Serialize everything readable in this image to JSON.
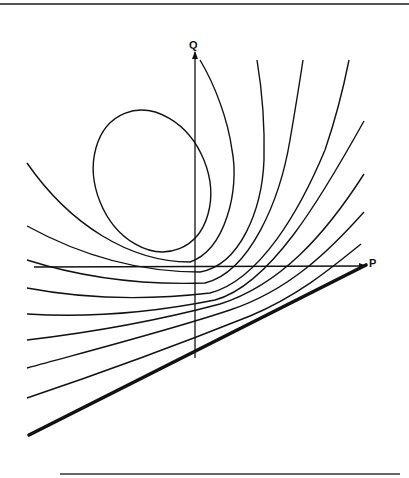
{
  "diagram": {
    "axes": {
      "vertical_label": "Q",
      "horizontal_label": "P"
    },
    "elements": {
      "ellipse": "closed-orbit",
      "curve_family": "hyperbolic-trajectories",
      "bold_line": "boundary-line"
    },
    "colors": {
      "line": "#111111",
      "background": "#ffffff"
    }
  }
}
